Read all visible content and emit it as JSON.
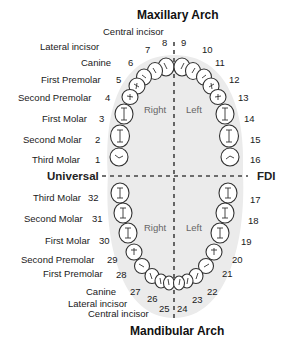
{
  "diagram": {
    "title_top": "Maxillary Arch",
    "title_bottom": "Mandibular Arch",
    "system_left": "Universal",
    "system_right": "FDI",
    "side_right": "Right",
    "side_left": "Left",
    "upper_labels": [
      {
        "name": "Central incisor",
        "num": "8"
      },
      {
        "name": "Lateral incisor",
        "num": "7"
      },
      {
        "name": "Canine",
        "num": "6"
      },
      {
        "name": "First Premolar",
        "num": "5"
      },
      {
        "name": "Second Premolar",
        "num": "4"
      },
      {
        "name": "First Molar",
        "num": "3"
      },
      {
        "name": "Second Molar",
        "num": "2"
      },
      {
        "name": "Third Molar",
        "num": "1"
      }
    ],
    "upper_right_numbers": [
      "9",
      "10",
      "11",
      "12",
      "13",
      "14",
      "15",
      "16"
    ],
    "lower_labels": [
      {
        "name": "Third Molar",
        "num": "32"
      },
      {
        "name": "Second Molar",
        "num": "31"
      },
      {
        "name": "First Molar",
        "num": "30"
      },
      {
        "name": "Second Premolar",
        "num": "29"
      },
      {
        "name": "First Premolar",
        "num": "28"
      },
      {
        "name": "Canine",
        "num": "27"
      },
      {
        "name": "Lateral incisor",
        "num": "26"
      },
      {
        "name": "Central incisor",
        "num": "25"
      }
    ],
    "lower_right_numbers": [
      "17",
      "18",
      "19",
      "20",
      "21",
      "22",
      "23",
      "24"
    ],
    "colors": {
      "background": "#ffffff",
      "arch_fill": "#ebebeb",
      "tooth_fill": "#ffffff",
      "outline": "#333333",
      "text": "#1a1a1a",
      "side_text": "#666666"
    }
  }
}
